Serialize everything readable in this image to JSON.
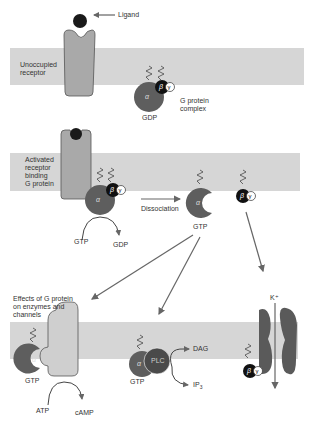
{
  "colors": {
    "membrane": "#d6d6d6",
    "receptor": "#a9a9a9",
    "ligand": "#1a1a1a",
    "alpha": "#5e5e5e",
    "beta": "#111111",
    "gamma": "#ffffff",
    "plc": "#4a4a4a",
    "channel": "#5a5a5a",
    "arrow": "#666666"
  },
  "panel1": {
    "ligand_label": "Ligand",
    "receptor_label": "Unoccupied\nreceptor",
    "gprotein_label": "G protein\ncomplex",
    "nucleotide": "GDP",
    "alpha": "α",
    "beta": "β",
    "gamma": "γ"
  },
  "panel2": {
    "receptor_label": "Activated\nreceptor\nbinding\nG protein",
    "gtp_in": "GTP",
    "gdp_out": "GDP",
    "dissociation_label": "Dissociation",
    "alpha_nucleotide": "GTP",
    "alpha": "α",
    "beta": "β",
    "gamma": "γ"
  },
  "panel3": {
    "effects_label": "Effects of G protein\non enzymes and\nchannels",
    "ac_gtp": "GTP",
    "atp": "ATP",
    "camp": "cAMP",
    "plc_label": "PLC",
    "plc_gtp": "GTP",
    "dag": "DAG",
    "ip3": "IP",
    "ip3_sub": "3",
    "ion_label": "K⁺",
    "alpha": "α",
    "beta": "β",
    "gamma": "γ"
  }
}
